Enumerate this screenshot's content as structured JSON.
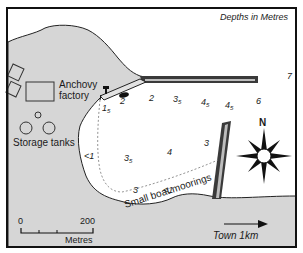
{
  "map": {
    "title": "Depths in Metres",
    "colors": {
      "land": "#d6d6d6",
      "water": "#ffffff",
      "frame": "#111111",
      "pier": "#2a2a2a"
    },
    "labels": {
      "factory": [
        "Anchovy",
        "factory"
      ],
      "storage": "Storage tanks",
      "moorings": "Small boat moorings",
      "town": "Town 1km",
      "compass_north": "N"
    },
    "scale_bar": {
      "start": "0",
      "end": "200",
      "unit": "Metres"
    },
    "depths": [
      {
        "main": "1",
        "sub": "5",
        "x": 102,
        "y": 104
      },
      {
        "main": "2",
        "sub": "",
        "x": 120,
        "y": 97
      },
      {
        "main": "2",
        "sub": "",
        "x": 149,
        "y": 94
      },
      {
        "main": "3",
        "sub": "5",
        "x": 173,
        "y": 95
      },
      {
        "main": "4",
        "sub": "5",
        "x": 201,
        "y": 98
      },
      {
        "main": "4",
        "sub": "5",
        "x": 225,
        "y": 101
      },
      {
        "main": "6",
        "sub": "",
        "x": 256,
        "y": 97
      },
      {
        "main": "7",
        "sub": "",
        "x": 287,
        "y": 72
      },
      {
        "main": "<1",
        "sub": "",
        "x": 84,
        "y": 152
      },
      {
        "main": "3",
        "sub": "5",
        "x": 124,
        "y": 154
      },
      {
        "main": "4",
        "sub": "",
        "x": 167,
        "y": 148
      },
      {
        "main": "3",
        "sub": "",
        "x": 204,
        "y": 139
      },
      {
        "main": "3",
        "sub": "",
        "x": 133,
        "y": 186
      },
      {
        "main": "<1",
        "sub": "",
        "x": 163,
        "y": 186
      }
    ]
  }
}
